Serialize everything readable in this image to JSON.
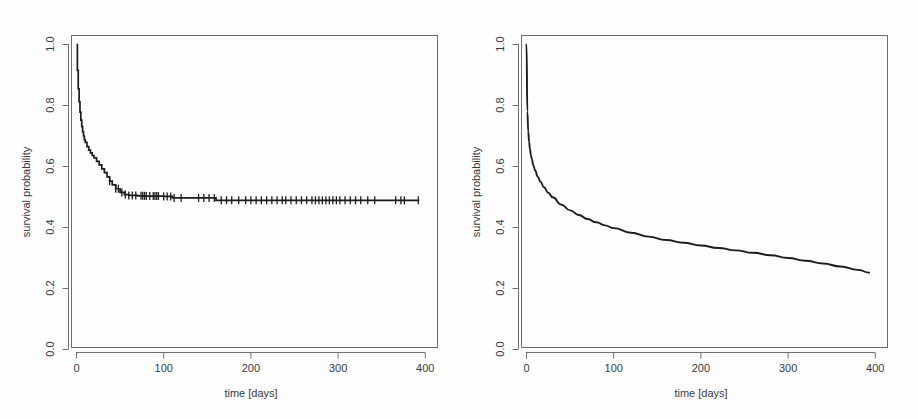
{
  "figure": {
    "width": 918,
    "height": 419,
    "background": "#fdfdfd",
    "panel_count": 2
  },
  "chart_data": [
    {
      "panel": "left",
      "type": "line",
      "subtype": "kaplan-meier-step",
      "title": "",
      "xlabel": "time [days]",
      "ylabel": "survival probability",
      "xlim": [
        0,
        400
      ],
      "ylim": [
        0.0,
        1.0
      ],
      "xticks": [
        0,
        100,
        200,
        300,
        400
      ],
      "xtick_labels": [
        "0",
        "100",
        "200",
        "300",
        "400"
      ],
      "yticks": [
        0.0,
        0.2,
        0.4,
        0.6,
        0.8,
        1.0
      ],
      "ytick_labels": [
        "0.0",
        "0.2",
        "0.4",
        "0.6",
        "0.8",
        "1.0"
      ],
      "grid": false,
      "legend": "none",
      "line_color": "#1c1c1c",
      "has_censoring_marks": true,
      "description": "Kaplan-Meier step estimate: sharp early drop then flat plateau near 0.49",
      "x": [
        0,
        1,
        2,
        3,
        4,
        5,
        6,
        7,
        8,
        9,
        10,
        12,
        14,
        16,
        18,
        20,
        23,
        26,
        29,
        32,
        35,
        38,
        41,
        45,
        50,
        55,
        60,
        70,
        80,
        90,
        100,
        110,
        120,
        135,
        150,
        158,
        160,
        175,
        200,
        230,
        260,
        300,
        340,
        393
      ],
      "y": [
        1.0,
        0.915,
        0.855,
        0.812,
        0.778,
        0.752,
        0.731,
        0.714,
        0.7,
        0.688,
        0.679,
        0.665,
        0.654,
        0.645,
        0.636,
        0.628,
        0.617,
        0.605,
        0.592,
        0.58,
        0.566,
        0.552,
        0.54,
        0.527,
        0.515,
        0.508,
        0.505,
        0.504,
        0.503,
        0.503,
        0.502,
        0.497,
        0.497,
        0.497,
        0.497,
        0.497,
        0.489,
        0.489,
        0.489,
        0.489,
        0.489,
        0.489,
        0.489,
        0.489
      ],
      "censoring_times": [
        38,
        45,
        48,
        52,
        56,
        60,
        64,
        68,
        74,
        76,
        78,
        80,
        84,
        88,
        90,
        92,
        94,
        100,
        104,
        108,
        112,
        120,
        140,
        146,
        152,
        158,
        166,
        172,
        178,
        186,
        194,
        200,
        206,
        212,
        218,
        224,
        230,
        236,
        240,
        246,
        252,
        258,
        264,
        270,
        274,
        278,
        282,
        286,
        290,
        294,
        298,
        302,
        308,
        314,
        320,
        326,
        334,
        342,
        366,
        372,
        376,
        392
      ],
      "plateau_value": 0.489
    },
    {
      "panel": "right",
      "type": "line",
      "subtype": "smooth-parametric-survival",
      "title": "",
      "xlabel": "time [days]",
      "ylabel": "survival probability",
      "xlim": [
        0,
        400
      ],
      "ylim": [
        0.0,
        1.0
      ],
      "xticks": [
        0,
        100,
        200,
        300,
        400
      ],
      "xtick_labels": [
        "0",
        "100",
        "200",
        "300",
        "400"
      ],
      "yticks": [
        0.0,
        0.2,
        0.4,
        0.6,
        0.8,
        1.0
      ],
      "ytick_labels": [
        "0.0",
        "0.2",
        "0.4",
        "0.6",
        "0.8",
        "1.0"
      ],
      "grid": false,
      "legend": "none",
      "line_color": "#1c1c1c",
      "has_censoring_marks": false,
      "description": "Smooth parametric survival curve: steep early drop then slow monotone decay to about 0.25",
      "x": [
        0,
        1,
        2,
        3,
        4,
        5,
        6,
        8,
        10,
        13,
        16,
        20,
        25,
        30,
        40,
        50,
        60,
        70,
        80,
        90,
        100,
        120,
        140,
        160,
        180,
        200,
        220,
        240,
        260,
        280,
        300,
        320,
        340,
        360,
        380,
        393
      ],
      "y": [
        1.0,
        0.78,
        0.715,
        0.68,
        0.657,
        0.639,
        0.625,
        0.603,
        0.586,
        0.566,
        0.55,
        0.532,
        0.514,
        0.499,
        0.475,
        0.456,
        0.441,
        0.428,
        0.417,
        0.407,
        0.398,
        0.383,
        0.37,
        0.359,
        0.35,
        0.341,
        0.333,
        0.325,
        0.317,
        0.309,
        0.3,
        0.291,
        0.282,
        0.272,
        0.261,
        0.252
      ],
      "end_value": 0.252
    }
  ],
  "axes": {
    "x_title": "time [days]",
    "y_title": "survival probability",
    "x_tick_labels": [
      "0",
      "100",
      "200",
      "300",
      "400"
    ],
    "y_tick_labels": [
      "0.0",
      "0.2",
      "0.4",
      "0.6",
      "0.8",
      "1.0"
    ]
  },
  "colors": {
    "curve": "#1c1c1c",
    "axis": "#6e6e6e",
    "text": "#3a3a3a",
    "background": "#fdfdfd"
  }
}
